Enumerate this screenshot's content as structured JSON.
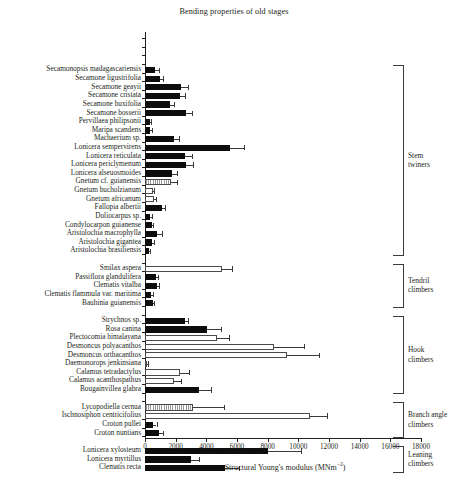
{
  "chart_data": {
    "type": "bar",
    "orientation": "horizontal",
    "title": "Bending properties of old stages",
    "xlabel": "Structural Young's modulus (MNm−2)",
    "ylabel": "",
    "xlim": [
      0,
      18000
    ],
    "xticks": [
      0,
      2000,
      4000,
      6000,
      8000,
      10000,
      12000,
      14000,
      16000,
      18000
    ],
    "grid": false,
    "legend": "none",
    "error_bars": "present (single-sided upper SD whiskers)",
    "groups": [
      {
        "name": "Stem twiners",
        "label_lines": [
          "Stem",
          "twiners"
        ]
      },
      {
        "name": "Tendril climbers",
        "label_lines": [
          "Tendril",
          "climbers"
        ]
      },
      {
        "name": "Hook climbers",
        "label_lines": [
          "Hook",
          "climbers"
        ]
      },
      {
        "name": "Branch angle climbers",
        "label_lines": [
          "Branch angle",
          "climbers"
        ]
      },
      {
        "name": "Leaning climbers",
        "label_lines": [
          "Leaning",
          "climbers"
        ]
      }
    ],
    "categories": [
      "Secamonopsis madagascariensis",
      "Secamone ligustrifolia",
      "Secamone geayii",
      "Secamone cristata",
      "Secamone buxifolia",
      "Secamone bosserii",
      "Pervillaea philipsonii",
      "Maripa scandens",
      "Machaerium sp.",
      "Lonicera sempervirens",
      "Lonicera reticulata",
      "Lonicera periclymenum",
      "Lonicera alseuosmoides",
      "Gnetum cf. guianensis",
      "Gnetum bucholzianum",
      "Gnetum africanum",
      "Fallopia albertii",
      "Doliocarpus sp.",
      "Condylocarpon guianense",
      "Aristolochia macrophylla",
      "Aristolochia gigantea",
      "Aristolochia brasiliensis",
      "Smilax aspera",
      "Passiflora glandulifera",
      "Clematis vitalba",
      "Clematis flammula var. maritima",
      "Bauhinia guianensis",
      "Strychnos sp.",
      "Rosa canina",
      "Plectocomia himalayana",
      "Desmoncus polyacanthos",
      "Desmoncus orthacanthos",
      "Daemonorops jenkinsiana",
      "Calamus tetradactylus",
      "Calamus acanthospathus",
      "Bougainvillea glabra",
      "Lycopodiella cernua",
      "Ischnosiphon centricifolius",
      "Croton pullei",
      "Croton nuntians",
      "Lonicera xylosteum",
      "Lonicera myrtillus",
      "Clematis recta"
    ],
    "values": [
      650,
      950,
      2350,
      2250,
      1600,
      2700,
      300,
      350,
      1900,
      5550,
      2600,
      2650,
      1750,
      1700,
      500,
      600,
      1100,
      350,
      450,
      800,
      450,
      250,
      5000,
      700,
      750,
      400,
      500,
      2600,
      4050,
      4700,
      8400,
      9250,
      120,
      2300,
      1900,
      3500,
      3100,
      10750,
      500,
      900,
      8000,
      3000,
      5200
    ],
    "errors": [
      250,
      250,
      450,
      350,
      300,
      350,
      100,
      100,
      300,
      900,
      450,
      450,
      350,
      400,
      100,
      120,
      180,
      80,
      90,
      300,
      130,
      60,
      700,
      120,
      180,
      90,
      110,
      220,
      900,
      750,
      2000,
      2100,
      60,
      550,
      480,
      800,
      2050,
      1100,
      250,
      250,
      2200,
      550,
      950
    ],
    "bar_styles": [
      "solid",
      "solid",
      "solid",
      "solid",
      "solid",
      "solid",
      "solid",
      "solid",
      "solid",
      "solid",
      "solid",
      "solid",
      "solid",
      "hatch",
      "open",
      "open",
      "solid",
      "solid",
      "solid",
      "solid",
      "solid",
      "solid",
      "open",
      "solid",
      "solid",
      "solid",
      "solid",
      "solid",
      "solid",
      "open",
      "open",
      "open",
      "open",
      "open",
      "open",
      "solid",
      "hatch",
      "open",
      "solid",
      "solid",
      "solid",
      "solid",
      "solid"
    ],
    "group_spans": [
      {
        "group": "Stem twiners",
        "start": 0,
        "end": 21
      },
      {
        "group": "Tendril climbers",
        "start": 22,
        "end": 26
      },
      {
        "group": "Hook climbers",
        "start": 27,
        "end": 35
      },
      {
        "group": "Branch angle climbers",
        "start": 36,
        "end": 39
      },
      {
        "group": "Leaning climbers",
        "start": 40,
        "end": 42
      }
    ]
  }
}
